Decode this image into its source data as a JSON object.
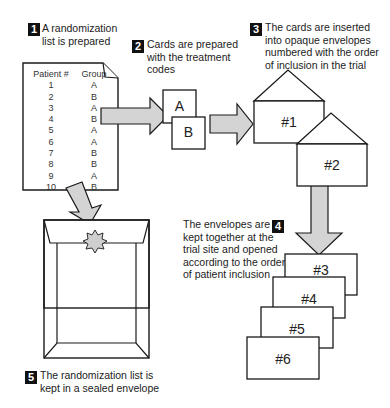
{
  "steps": [
    {
      "number": "1",
      "text_lines": [
        "A randomization",
        "list is prepared"
      ]
    },
    {
      "number": "2",
      "text_lines": [
        "Cards are prepared",
        "with the treatment",
        "codes"
      ]
    },
    {
      "number": "3",
      "text_lines": [
        "The cards are inserted",
        "into opaque envelopes",
        "numbered with the order",
        "of inclusion in the trial"
      ]
    },
    {
      "number": "4",
      "text_lines": [
        "The envelopes are",
        "kept together at the",
        "trial site and opened",
        "according to the order",
        "of patient inclusion"
      ]
    },
    {
      "number": "5",
      "text_lines": [
        "The randomization list is",
        "kept in a sealed envelope"
      ]
    }
  ],
  "randomization_list": {
    "headers": [
      "Patient #",
      "Group"
    ],
    "rows": [
      [
        "1",
        "A"
      ],
      [
        "2",
        "B"
      ],
      [
        "3",
        "A"
      ],
      [
        "4",
        "B"
      ],
      [
        "5",
        "A"
      ],
      [
        "6",
        "A"
      ],
      [
        "7",
        "B"
      ],
      [
        "8",
        "B"
      ],
      [
        "9",
        "A"
      ],
      [
        "10",
        "B"
      ]
    ]
  },
  "cards": [
    "A",
    "B"
  ],
  "envelopes": [
    "#1",
    "#2",
    "#3",
    "#4",
    "#5",
    "#6"
  ],
  "colors": {
    "arrow_fill": "#d4d4d4",
    "stroke": "#1a1a1a",
    "badge": "#111111",
    "seal": "#cfcfcf"
  }
}
